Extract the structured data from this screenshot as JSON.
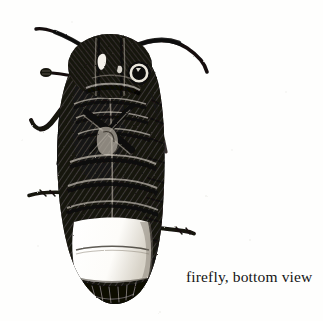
{
  "page": {
    "width": 323,
    "height": 321,
    "background_color": "#fefefd",
    "ink_color": "#111111",
    "medium": "scratchboard / wood-engraving style black-and-white illustration"
  },
  "caption": {
    "text": "firefly, bottom view",
    "color": "#141414",
    "align": "lower-right"
  },
  "illustration": {
    "subject": "firefly",
    "view": "ventral (bottom) view",
    "orientation": "head up, abdomen down",
    "bounding_box": {
      "x": 40,
      "y": 32,
      "width": 130,
      "height": 272
    },
    "parts": [
      {
        "name": "left-antenna",
        "description": "long curved antenna arcing up and to the left from the head"
      },
      {
        "name": "right-antenna",
        "description": "long curved antenna arcing up and to the right from the head"
      },
      {
        "name": "left-maxillary-palp",
        "description": "short clubbed palp projecting left from the mouthparts"
      },
      {
        "name": "pronotum",
        "description": "broad dark rounded shield covering the head"
      },
      {
        "name": "compound-eye",
        "description": "ring-shaped eye with pale highlight on the right side of the head"
      },
      {
        "name": "head-highlight",
        "description": "small white comma-shaped highlight on the left of the pronotum"
      },
      {
        "name": "thorax",
        "description": "densely cross-hatched ventral thorax with overlapping plates"
      },
      {
        "name": "fore-leg-left",
        "description": "angled foreleg folded against the body on the left"
      },
      {
        "name": "fore-leg-right",
        "description": "angled foreleg folded against the body on the right"
      },
      {
        "name": "mid-leg-left",
        "description": "middle leg projecting left from the thorax"
      },
      {
        "name": "mid-leg-right",
        "description": "middle leg projecting right from the thorax"
      },
      {
        "name": "hind-leg-left",
        "description": "hind leg extending horizontally to the left at mid-abdomen"
      },
      {
        "name": "hind-leg-right",
        "description": "hind leg extending horizontally to the right below mid-abdomen"
      },
      {
        "name": "elytra-edge-left",
        "description": "dark solid wing-case margin down the left side"
      },
      {
        "name": "elytra-edge-right",
        "description": "stippled, fading wing-case margin down the right side"
      },
      {
        "name": "abdominal-segments",
        "description": "series of dark cross-hatched abdominal bands"
      },
      {
        "name": "light-organ",
        "description": "large pale two-segment luminous organ (lantern) on the lower abdomen"
      },
      {
        "name": "abdomen-tip",
        "description": "dark rounded terminal abdominal segments at the bottom"
      }
    ]
  }
}
